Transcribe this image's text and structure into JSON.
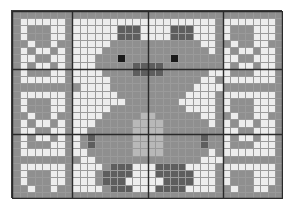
{
  "document": {
    "type": "cross-stitch-chart",
    "title": "Teddy Bear Pattern Chart",
    "background_color": "#ffffff"
  },
  "chart_data": {
    "type": "heatmap",
    "subtitle": "",
    "xlabel": "",
    "ylabel": "",
    "grid": true,
    "legend_position": "none",
    "columns": 36,
    "rows": 26,
    "cell_width": 7.52,
    "cell_height": 7.23,
    "origin_x": 11,
    "origin_y": 10,
    "grid_line_color": "#9a9a9a",
    "heavy_line_color": "#2a2a2a",
    "heavy_line_every": 10,
    "heavy_columns": [
      0,
      8,
      18,
      28,
      36
    ],
    "heavy_rows": [
      0,
      8,
      17,
      26
    ],
    "palette": {
      "0": "#ededed",
      "1": "#8f8f8f",
      "2": "#b8b8b8",
      "3": "#5e5e5e",
      "4": "#1a1a1a",
      "5": "#d2d2d2"
    },
    "palette_names": {
      "0": "blank-background",
      "1": "medium-gray-fill",
      "2": "light-gray-fill",
      "3": "dark-gray-fill",
      "4": "black-fill",
      "5": "pale-gray-fill"
    },
    "cells": [
      "111111111111111111111111111111111111",
      "100000010000000000000000000100000001",
      "101110010000003330000333000101110001",
      "101110010000003330000333000101110001",
      "110110110000011111111111100110110011",
      "101001010000111111111111110101001001",
      "100110010001114111111411111100110001",
      "101001010001111133331111111101001001",
      "101110010000111133331111110001110001",
      "100000010000011111111111100100000001",
      "111111111000011111111111000011111111",
      "100000010000001111111110000100000001",
      "101110010000000111111100000101110001",
      "101110010000011111111110000101110001",
      "110110110000111112211111100110110011",
      "101001010001111122221111110101001001",
      "100110010011111122221111111100110001",
      "101001010131111122221111131101001001",
      "101110010131111122221111131101110001",
      "100000010011111122221111110100000001",
      "111111111001111111111111100011111111",
      "100000010000133300033330000100000001",
      "101110010001333300033333000101110001",
      "101110010001333000003333000101110001",
      "110110110000133300033330000110110011",
      "111111111111111111111111111111111111"
    ]
  }
}
